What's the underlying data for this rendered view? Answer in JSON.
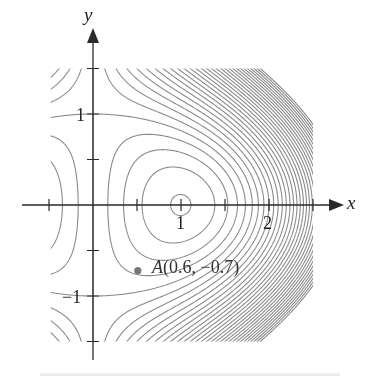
{
  "chart_data": {
    "type": "contour",
    "title": "",
    "function": "f(x,y) = x^3 + 3xy^2 - 3x",
    "xlabel": "x",
    "ylabel": "y",
    "xlim": [
      -0.6,
      2.9
    ],
    "ylim": [
      -1.55,
      1.95
    ],
    "domain_region": {
      "x": [
        -0.48,
        2.5
      ],
      "y": [
        -1.5,
        1.5
      ]
    },
    "x_ticks": [
      -0.5,
      0.5,
      1,
      1.5,
      2,
      2.5
    ],
    "x_tick_labels": [
      {
        "value": 1,
        "text": "1"
      },
      {
        "value": 2,
        "text": "2"
      }
    ],
    "y_ticks": [
      -1.5,
      -1,
      -0.5,
      0.5,
      1,
      1.5
    ],
    "y_tick_labels": [
      {
        "value": 1,
        "text": "1"
      },
      {
        "value": -1,
        "text": "−1"
      }
    ],
    "contour_levels": {
      "start": -4.0,
      "step": 0.5,
      "end": 14.0,
      "extra": [
        -1.96
      ]
    },
    "critical_points": [
      {
        "x": 1,
        "y": 0,
        "kind": "local minimum"
      },
      {
        "x": 0,
        "y": 1,
        "kind": "saddle"
      },
      {
        "x": 0,
        "y": -1,
        "kind": "saddle"
      }
    ],
    "annotations": [
      {
        "name": "A",
        "x": 0.6,
        "y": -0.7,
        "text": "(0.6, −0.7)"
      }
    ],
    "grid": false,
    "legend": null,
    "colors": {
      "contour": "#8a8a8a",
      "axis": "#2a2a2a",
      "point": "#777777"
    }
  },
  "labels": {
    "x_axis": "x",
    "y_axis": "y",
    "tick_x1": "1",
    "tick_x2": "2",
    "tick_y1": "1",
    "tick_ym1": "−1",
    "point_name": "A",
    "point_coords": "(0.6, −0.7)"
  }
}
